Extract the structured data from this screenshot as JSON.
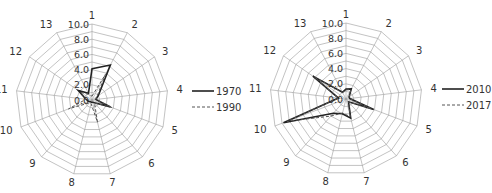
{
  "chart_data": [
    {
      "type": "radar",
      "title": "",
      "categories": [
        "1",
        "2",
        "3",
        "4",
        "5",
        "6",
        "7",
        "8",
        "9",
        "10",
        "11",
        "12",
        "13"
      ],
      "radial_ticks": [
        "0.0",
        "2.0",
        "4.0",
        "6.0",
        "8.0",
        "10.0"
      ],
      "rlim": [
        0,
        10
      ],
      "grid": true,
      "legend_position": "right",
      "series": [
        {
          "name": "1970",
          "style": "solid",
          "values": [
            4.1,
            5.2,
            1.0,
            0.5,
            2.6,
            0.5,
            0.3,
            0.3,
            0.3,
            0.5,
            0.8,
            2.2,
            1.0
          ]
        },
        {
          "name": "1990",
          "style": "dashed",
          "values": [
            0.5,
            3.8,
            0.8,
            0.5,
            2.8,
            0.5,
            3.0,
            0.5,
            0.5,
            3.3,
            0.8,
            1.8,
            0.8
          ]
        }
      ]
    },
    {
      "type": "radar",
      "title": "",
      "categories": [
        "1",
        "2",
        "3",
        "4",
        "5",
        "6",
        "7",
        "8",
        "9",
        "10",
        "11",
        "12",
        "13"
      ],
      "radial_ticks": [
        "0.0",
        "2.0",
        "4.0",
        "6.0",
        "8.0",
        "10.0"
      ],
      "rlim": [
        0,
        10
      ],
      "grid": true,
      "legend_position": "right",
      "series": [
        {
          "name": "2010",
          "style": "solid",
          "values": [
            1.3,
            1.5,
            0.5,
            0.5,
            3.9,
            0.5,
            2.6,
            2.0,
            2.5,
            8.8,
            1.0,
            5.3,
            1.0
          ]
        },
        {
          "name": "2017",
          "style": "dashed",
          "values": [
            1.2,
            1.4,
            0.5,
            0.5,
            3.6,
            0.5,
            2.4,
            1.9,
            3.0,
            8.3,
            1.0,
            5.0,
            1.0
          ]
        }
      ]
    }
  ],
  "charts_layout": [
    {
      "cx": 92,
      "cy": 100,
      "r": 76,
      "legend_x": 192,
      "legend_y": 91
    },
    {
      "cx": 346,
      "cy": 99,
      "r": 76,
      "legend_x": 442,
      "legend_y": 89
    }
  ]
}
